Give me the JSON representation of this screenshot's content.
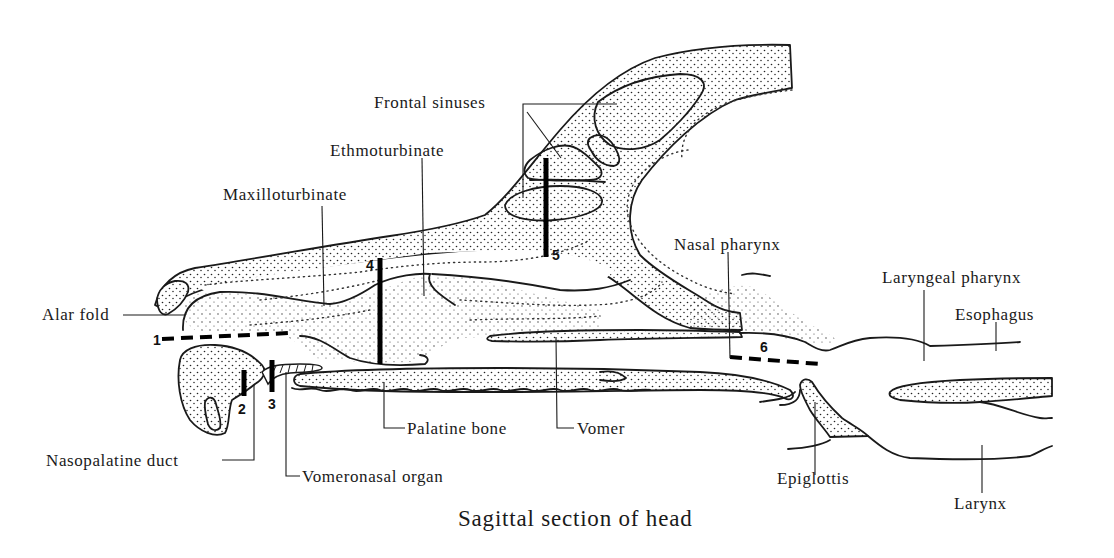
{
  "figure": {
    "title": "Sagittal section of head",
    "background": "#ffffff",
    "ink_color": "#1a1a1a"
  },
  "labels": {
    "frontal_sinuses": "Frontal sinuses",
    "ethmoturbinate": "Ethmoturbinate",
    "maxilloturbinate": "Maxilloturbinate",
    "alar_fold": "Alar fold",
    "nasal_pharynx": "Nasal pharynx",
    "laryngeal_pharynx": "Laryngeal pharynx",
    "esophagus": "Esophagus",
    "palatine_bone": "Palatine bone",
    "vomer": "Vomer",
    "nasopalatine_duct": "Nasopalatine duct",
    "vomeronasal_organ": "Vomeronasal organ",
    "epiglottis": "Epiglottis",
    "larynx": "Larynx"
  },
  "section_markers": [
    {
      "id": "1",
      "label": "1",
      "style": "dashed-horizontal"
    },
    {
      "id": "2",
      "label": "2",
      "style": "solid-vertical"
    },
    {
      "id": "3",
      "label": "3",
      "style": "solid-vertical"
    },
    {
      "id": "4",
      "label": "4",
      "style": "solid-vertical"
    },
    {
      "id": "5",
      "label": "5",
      "style": "solid-vertical"
    },
    {
      "id": "6",
      "label": "6",
      "style": "dashed-oblique"
    }
  ]
}
